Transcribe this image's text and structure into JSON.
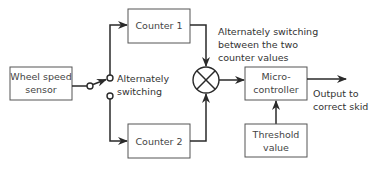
{
  "diagram": {
    "blocks": {
      "sensor": {
        "line1": "Wheel speed",
        "line2": "sensor"
      },
      "counter1": {
        "label": "Counter 1"
      },
      "counter2": {
        "label": "Counter 2"
      },
      "microcontroller": {
        "line1": "Micro-",
        "line2": "controller"
      },
      "threshold": {
        "line1": "Threshold",
        "line2": "value"
      }
    },
    "annotations": {
      "switch": {
        "line1": "Alternately",
        "line2": "switching"
      },
      "comparator": {
        "line1": "Alternately switching",
        "line2": "between the two",
        "line3": "counter values"
      },
      "output": {
        "line1": "Output to",
        "line2": "correct skid"
      }
    },
    "symbols": {
      "switch": "switch-symbol",
      "comparator": "summing-junction-x-circle"
    },
    "colors": {
      "stroke": "#2a2a2a",
      "box_border": "#555555",
      "text": "#333333",
      "background": "#ffffff"
    }
  }
}
